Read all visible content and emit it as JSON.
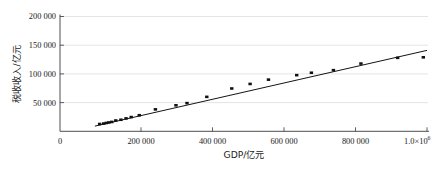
{
  "figure": {
    "background": "#ffffff",
    "point_color": "#111111",
    "line_color": "#141414",
    "axis_color": "#3a3a3a",
    "grid_color": "#d9d9d9"
  },
  "chart_data": {
    "type": "scatter",
    "title": "",
    "subtitle": "",
    "xlabel": "GDP/亿元",
    "ylabel": "税收收入/亿元",
    "xlim": [
      0,
      1050000
    ],
    "ylim": [
      0,
      205000
    ],
    "grid": true,
    "grid_axis": "y",
    "legend": null,
    "legend_position": "none",
    "x_ticks": [
      0,
      200000,
      400000,
      600000,
      800000,
      1000000
    ],
    "x_tick_labels": [
      "0",
      "200 000",
      "400 000",
      "600 000",
      "800 000",
      "1.0×10⁶"
    ],
    "x_tick_last_base": "1.0×10",
    "x_tick_last_exp": "6",
    "y_ticks": [
      50000,
      100000,
      150000,
      200000
    ],
    "y_tick_labels": [
      "50 000",
      "100 000",
      "150 000",
      "200 000"
    ],
    "series": [
      {
        "name": "税收收入与GDP散点",
        "marker": "square",
        "points": [
          [
            108000,
            12700
          ],
          [
            119000,
            13500
          ],
          [
            126000,
            14500
          ],
          [
            133000,
            15400
          ],
          [
            141000,
            16300
          ],
          [
            152000,
            18800
          ],
          [
            166000,
            20100
          ],
          [
            180000,
            22500
          ],
          [
            194000,
            24800
          ],
          [
            216000,
            28000
          ],
          [
            260000,
            38200
          ],
          [
            316000,
            45300
          ],
          [
            346000,
            49100
          ],
          [
            400000,
            60000
          ],
          [
            468000,
            74600
          ],
          [
            518000,
            82500
          ],
          [
            568000,
            90000
          ],
          [
            645000,
            97800
          ],
          [
            685000,
            102000
          ],
          [
            745000,
            106500
          ],
          [
            820000,
            118000
          ],
          [
            920000,
            128000
          ],
          [
            990000,
            128900
          ]
        ]
      }
    ],
    "fit_line": {
      "name": "线性拟合线",
      "x_start": 95000,
      "y_start": 9000,
      "x_end": 1000000,
      "y_end": 141000
    }
  }
}
